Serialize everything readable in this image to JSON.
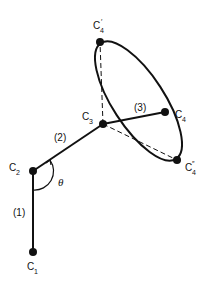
{
  "diagram": {
    "nodes": [
      {
        "id": "C1",
        "label": "C",
        "sub": "1",
        "prime": "",
        "x": 33,
        "y": 252,
        "lx": 27,
        "ly": 272
      },
      {
        "id": "C2",
        "label": "C",
        "sub": "2",
        "prime": "",
        "x": 33,
        "y": 171,
        "lx": 9,
        "ly": 171
      },
      {
        "id": "C3",
        "label": "C",
        "sub": "3",
        "prime": "",
        "x": 103,
        "y": 124,
        "lx": 83,
        "ly": 120
      },
      {
        "id": "C4",
        "label": "C",
        "sub": "4",
        "prime": "",
        "x": 165,
        "y": 112,
        "lx": 175,
        "ly": 118
      },
      {
        "id": "C4p",
        "label": "C",
        "sub": "4",
        "prime": "′",
        "x": 100,
        "y": 42,
        "lx": 93,
        "ly": 30
      },
      {
        "id": "C4pp",
        "label": "C",
        "sub": "4",
        "prime": "″",
        "x": 177,
        "y": 160,
        "lx": 185,
        "ly": 173
      }
    ],
    "bonds": [
      {
        "label": "(1)",
        "lx": 14,
        "ly": 215
      },
      {
        "label": "(2)",
        "lx": 55,
        "ly": 140
      },
      {
        "label": "(3)",
        "lx": 135,
        "ly": 111
      }
    ],
    "angle_label": "θ"
  }
}
